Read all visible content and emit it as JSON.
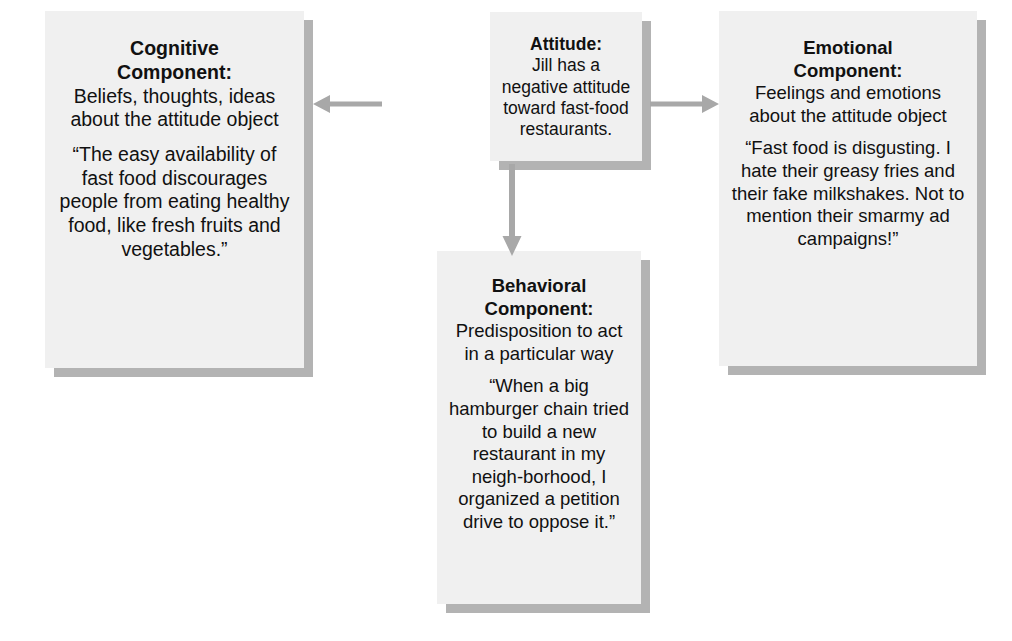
{
  "diagram": {
    "accent_box_fill": "#f0f0f0",
    "accent_shadow": "#b3b3b3",
    "arrow_color": "#a8a8a8",
    "text_color": "#111111"
  },
  "boxes": {
    "cognitive": {
      "title": "Cognitive\nComponent:",
      "title_line1": "Cognitive",
      "title_line2": "Component:",
      "description": "Beliefs, thoughts, ideas about the attitude object",
      "quote": "“The easy availability of fast food discourages people from eating healthy food, like fresh fruits and vegetables.”"
    },
    "attitude": {
      "title": "Attitude:",
      "description": "Jill has a negative attitude toward fast-food restaurants."
    },
    "emotional": {
      "title_line1": "Emotional",
      "title_line2": "Component:",
      "description": "Feelings and emotions about the attitude object",
      "quote": "“Fast food is disgusting. I hate their greasy fries and their fake milkshakes. Not to mention their smarmy ad campaigns!”"
    },
    "behavioral": {
      "title_line1": "Behavioral",
      "title_line2": "Component:",
      "description": "Predisposition to act in a particular way",
      "quote": "“When a big hamburger chain tried to build a new restaurant in my neigh-borhood, I organized a petition drive to oppose it.”"
    }
  },
  "arrows": [
    {
      "name": "attitude-to-cognitive",
      "direction": "left"
    },
    {
      "name": "attitude-to-emotional",
      "direction": "right"
    },
    {
      "name": "attitude-to-behavioral",
      "direction": "down"
    }
  ]
}
